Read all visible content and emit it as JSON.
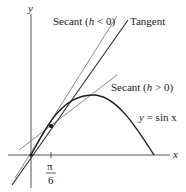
{
  "diagram": {
    "axes": {
      "x_label": "x",
      "y_label": "y"
    },
    "tick": {
      "numerator": "π",
      "denominator": "6"
    },
    "labels": {
      "secant_neg": "Secant (h < 0)",
      "secant_neg_pre": "Secant (",
      "secant_neg_h": "h",
      "secant_neg_post": " < 0)",
      "tangent": "Tangent",
      "secant_pos": "Secant (h > 0)",
      "secant_pos_pre": "Secant (",
      "secant_pos_h": "h",
      "secant_pos_post": " > 0)",
      "curve": "y = sin x",
      "curve_y": "y",
      "curve_rest": " = sin x"
    },
    "colors": {
      "curve": "#1a1a1a",
      "tangent": "#2a2a2a",
      "secant": "#8a8a8a",
      "axis": "#555555"
    }
  }
}
